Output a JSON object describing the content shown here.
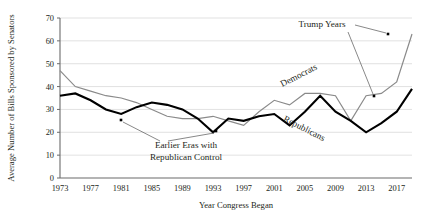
{
  "chart_data": {
    "type": "line",
    "title": "",
    "xlabel": "Year Congress Began",
    "ylabel": "Average Number of Bills Sponsored by Senators",
    "xlim": [
      1973,
      2019
    ],
    "ylim": [
      0,
      70
    ],
    "ytick_step": 10,
    "grid": "horizontal",
    "legend_position": "inline-labels",
    "x": [
      1973,
      1975,
      1977,
      1979,
      1981,
      1983,
      1985,
      1987,
      1989,
      1991,
      1993,
      1995,
      1997,
      1999,
      2001,
      2003,
      2005,
      2007,
      2009,
      2011,
      2013,
      2015,
      2017,
      2019
    ],
    "xticks": [
      "1973",
      "1977",
      "1981",
      "1985",
      "1989",
      "1993",
      "1997",
      "2001",
      "2005",
      "2009",
      "2013",
      "2017"
    ],
    "yticks": [
      "0",
      "10",
      "20",
      "30",
      "40",
      "50",
      "60",
      "70"
    ],
    "series": [
      {
        "name": "Democrats",
        "color": "#8a8a8a",
        "width": 1.2,
        "values": [
          47,
          40,
          38,
          36,
          35,
          33,
          30,
          27,
          26,
          26,
          27,
          25,
          23,
          29,
          34,
          32,
          37,
          37,
          36,
          25,
          36,
          37,
          42,
          63
        ]
      },
      {
        "name": "Republicans",
        "color": "#000000",
        "width": 2.1,
        "values": [
          36,
          37,
          34,
          30,
          28,
          31,
          33,
          32,
          30,
          26,
          20,
          26,
          25,
          27,
          28,
          23,
          29,
          36,
          29,
          25,
          20,
          24,
          29,
          39
        ]
      }
    ],
    "series_labels": [
      {
        "text": "Democrats",
        "x": 300,
        "y": 78,
        "rotate": -27
      },
      {
        "text": "Republicans",
        "x": 303,
        "y": 131,
        "rotate": 27
      }
    ],
    "annotations": [
      {
        "name": "earlier-eras-annotation",
        "lines": [
          "Earlier Eras with",
          "Republican Control"
        ],
        "text_x": 186,
        "text_y": 148,
        "markers": [
          {
            "x": 121,
            "y": 120
          },
          {
            "x": 216,
            "y": 131
          }
        ],
        "leaders": [
          {
            "x1": 160,
            "y1": 141,
            "x2": 123,
            "y2": 122
          },
          {
            "x1": 168,
            "y1": 141,
            "x2": 214,
            "y2": 133
          }
        ]
      },
      {
        "name": "trump-years-annotation",
        "lines": [
          "Trump Years"
        ],
        "text_x": 322,
        "text_y": 27,
        "markers": [
          {
            "x": 388,
            "y": 34
          },
          {
            "x": 374,
            "y": 96
          }
        ],
        "leaders": [
          {
            "x1": 355,
            "y1": 25,
            "x2": 386,
            "y2": 33
          },
          {
            "x1": 348,
            "y1": 32,
            "x2": 373,
            "y2": 94
          }
        ]
      }
    ],
    "colors": {
      "democrats": "#8a8a8a",
      "republicans": "#000000",
      "gridline": "#d9d9d9",
      "axis": "#6b6b6b",
      "text": "#231f20"
    }
  }
}
